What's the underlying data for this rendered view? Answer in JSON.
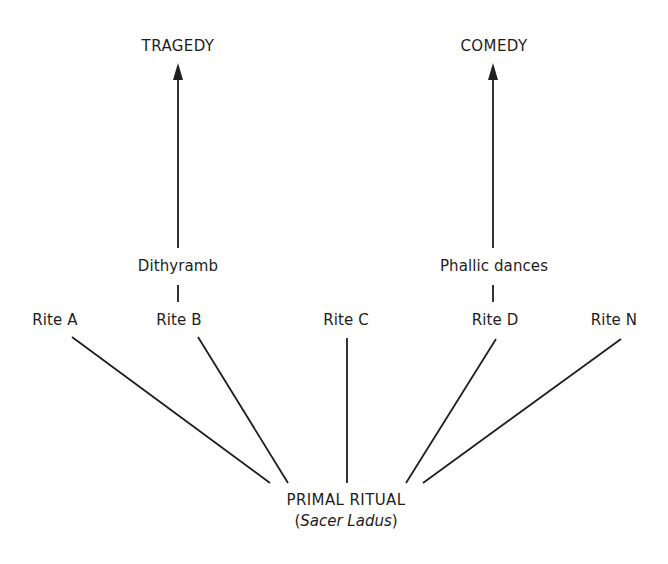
{
  "diagram": {
    "type": "derivation-tree",
    "outcomes": {
      "tragedy": {
        "label": "TRAGEDY",
        "via": "Dithyramb",
        "from_rite": "Rite B"
      },
      "comedy": {
        "label": "COMEDY",
        "via": "Phallic dances",
        "from_rite": "Rite D"
      }
    },
    "intermediates": {
      "dithyramb": "Dithyramb",
      "phallic_dances": "Phallic dances"
    },
    "rites": [
      {
        "id": "A",
        "label": "Rite A"
      },
      {
        "id": "B",
        "label": "Rite B"
      },
      {
        "id": "C",
        "label": "Rite C"
      },
      {
        "id": "D",
        "label": "Rite D"
      },
      {
        "id": "N",
        "label": "Rite N"
      }
    ],
    "root": {
      "label": "PRIMAL RITUAL",
      "sublabel_open": "(",
      "sublabel_italic": "Sacer Ladus",
      "sublabel_close": ")"
    },
    "colors": {
      "line": "#1e1e1e",
      "text": "#1e1e1e",
      "background": "#ffffff"
    }
  }
}
